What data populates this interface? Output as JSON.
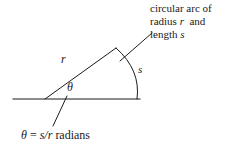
{
  "figure": {
    "background_color": "#ffffff",
    "stroke_color": "#1a1a1a",
    "stroke_width": 1,
    "labels": {
      "radius": "r",
      "arc": "s",
      "angle": "θ"
    },
    "callout": {
      "line1": "circular arc of",
      "line2_prefix": "radius",
      "line2_var": "r",
      "line2_suffix": "and",
      "line3_prefix": "length",
      "line3_var": "s"
    },
    "formula": {
      "angle": "θ",
      "equals": "=",
      "expression": "s/r",
      "unit": "radians"
    },
    "geometry": {
      "vertex": [
        45,
        99
      ],
      "baseline_start": [
        13,
        99
      ],
      "baseline_end": [
        140,
        99
      ],
      "apex": [
        116,
        48
      ],
      "arc_end": [
        137,
        99
      ],
      "arc_bulge": [
        140,
        73
      ],
      "callout_leader_start": [
        120,
        61
      ],
      "callout_leader_end": [
        152,
        33
      ],
      "angle_leader_start": [
        67,
        96
      ],
      "angle_leader_end": [
        53,
        126
      ]
    }
  }
}
